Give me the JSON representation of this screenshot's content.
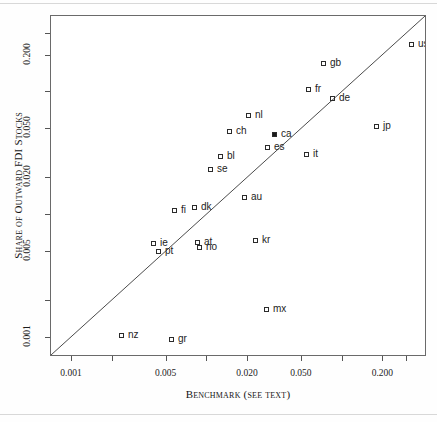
{
  "figure": {
    "domain": "chart"
  },
  "chart_data": {
    "type": "scatter",
    "title": "",
    "xlabel": "Benchmark (see text)",
    "ylabel": "Share of Outward FDI Stocks",
    "xscale": "log",
    "yscale": "log",
    "grid": false,
    "legend": null,
    "xlim": [
      0.0007,
      0.42
    ],
    "ylim": [
      0.0007,
      0.42
    ],
    "xticks": [
      "0.001",
      "0.005",
      "0.020",
      "0.050",
      "0.200"
    ],
    "xtick_values": [
      0.001,
      0.005,
      0.02,
      0.05,
      0.2
    ],
    "yticks": [
      "0.001",
      "0.005",
      "0.020",
      "0.050",
      "0.200"
    ],
    "ytick_values": [
      0.001,
      0.005,
      0.02,
      0.05,
      0.2
    ],
    "reference_line": {
      "type": "45-degree",
      "description": "y = x diagonal"
    },
    "marker_style": "open square",
    "points": [
      {
        "label": "us",
        "x": 0.3,
        "y": 0.3,
        "filled": false,
        "px": 410,
        "py": 43,
        "lx": 417,
        "ly": 38
      },
      {
        "label": "gb",
        "x": 0.078,
        "y": 0.235,
        "filled": false,
        "px": 322,
        "py": 62,
        "lx": 329,
        "ly": 57
      },
      {
        "label": "fr",
        "x": 0.055,
        "y": 0.135,
        "filled": false,
        "px": 307,
        "py": 88,
        "lx": 314,
        "ly": 83
      },
      {
        "label": "de",
        "x": 0.075,
        "y": 0.12,
        "filled": false,
        "px": 331,
        "py": 97,
        "lx": 338,
        "ly": 92
      },
      {
        "label": "jp",
        "x": 0.165,
        "y": 0.072,
        "filled": false,
        "px": 375,
        "py": 125,
        "lx": 382,
        "ly": 120
      },
      {
        "label": "nl",
        "x": 0.024,
        "y": 0.082,
        "filled": false,
        "px": 247,
        "py": 114,
        "lx": 254,
        "ly": 109
      },
      {
        "label": "ch",
        "x": 0.016,
        "y": 0.066,
        "filled": false,
        "px": 228,
        "py": 130,
        "lx": 235,
        "ly": 125
      },
      {
        "label": "ca",
        "x": 0.03,
        "y": 0.06,
        "filled": true,
        "px": 273,
        "py": 133,
        "lx": 280,
        "ly": 128
      },
      {
        "label": "es",
        "x": 0.028,
        "y": 0.05,
        "filled": false,
        "px": 266,
        "py": 146,
        "lx": 273,
        "ly": 141
      },
      {
        "label": "it",
        "x": 0.045,
        "y": 0.045,
        "filled": false,
        "px": 305,
        "py": 153,
        "lx": 312,
        "ly": 148
      },
      {
        "label": "bl",
        "x": 0.013,
        "y": 0.036,
        "filled": false,
        "px": 219,
        "py": 155,
        "lx": 226,
        "ly": 150
      },
      {
        "label": "se",
        "x": 0.01,
        "y": 0.03,
        "filled": false,
        "px": 209,
        "py": 168,
        "lx": 216,
        "ly": 163
      },
      {
        "label": "au",
        "x": 0.026,
        "y": 0.02,
        "filled": false,
        "px": 243,
        "py": 196,
        "lx": 250,
        "ly": 191
      },
      {
        "label": "fi",
        "x": 0.0072,
        "y": 0.015,
        "filled": false,
        "px": 173,
        "py": 209,
        "lx": 180,
        "ly": 204
      },
      {
        "label": "dk",
        "x": 0.009,
        "y": 0.016,
        "filled": false,
        "px": 193,
        "py": 206,
        "lx": 200,
        "ly": 201
      },
      {
        "label": "at",
        "x": 0.0094,
        "y": 0.0085,
        "filled": false,
        "px": 196,
        "py": 241,
        "lx": 203,
        "ly": 236
      },
      {
        "label": "no",
        "x": 0.0097,
        "y": 0.0078,
        "filled": false,
        "px": 198,
        "py": 246,
        "lx": 205,
        "ly": 241
      },
      {
        "label": "kr",
        "x": 0.028,
        "y": 0.0085,
        "filled": false,
        "px": 254,
        "py": 239,
        "lx": 261,
        "ly": 234
      },
      {
        "label": "ie",
        "x": 0.0045,
        "y": 0.0082,
        "filled": false,
        "px": 152,
        "py": 242,
        "lx": 159,
        "ly": 237
      },
      {
        "label": "pt",
        "x": 0.005,
        "y": 0.007,
        "filled": false,
        "px": 157,
        "py": 250,
        "lx": 164,
        "ly": 245
      },
      {
        "label": "mx",
        "x": 0.029,
        "y": 0.0025,
        "filled": false,
        "px": 265,
        "py": 308,
        "lx": 272,
        "ly": 303
      },
      {
        "label": "nz",
        "x": 0.0028,
        "y": 0.0012,
        "filled": false,
        "px": 120,
        "py": 334,
        "lx": 127,
        "ly": 329
      },
      {
        "label": "gr",
        "x": 0.0055,
        "y": 0.0011,
        "filled": false,
        "px": 170,
        "py": 338,
        "lx": 177,
        "ly": 333
      }
    ]
  }
}
